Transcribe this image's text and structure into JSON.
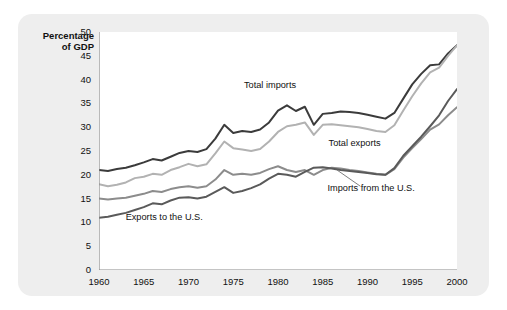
{
  "axis_title": "Percentage\nof GDP",
  "chart_data": {
    "type": "line",
    "title": "",
    "xlabel": "",
    "ylabel": "Percentage of GDP",
    "xlim": [
      1960,
      2000
    ],
    "ylim": [
      0,
      50
    ],
    "grid": false,
    "legend_position": "inline-annotations",
    "y_ticks": [
      0,
      5,
      10,
      15,
      20,
      25,
      30,
      35,
      40,
      45,
      50
    ],
    "x_ticks": [
      1960,
      1965,
      1970,
      1975,
      1980,
      1985,
      1990,
      1995,
      2000
    ],
    "x": [
      1960,
      1961,
      1962,
      1963,
      1964,
      1965,
      1966,
      1967,
      1968,
      1969,
      1970,
      1971,
      1972,
      1973,
      1974,
      1975,
      1976,
      1977,
      1978,
      1979,
      1980,
      1981,
      1982,
      1983,
      1984,
      1985,
      1986,
      1987,
      1988,
      1989,
      1990,
      1991,
      1992,
      1993,
      1994,
      1995,
      1996,
      1997,
      1998,
      1999,
      2000
    ],
    "series": [
      {
        "name": "Total imports",
        "color": "#3b3b3b",
        "values": [
          21.0,
          20.8,
          21.2,
          21.5,
          22.0,
          22.6,
          23.3,
          23.0,
          23.8,
          24.6,
          25.0,
          24.8,
          25.4,
          27.6,
          30.5,
          28.8,
          29.2,
          29.0,
          29.5,
          31.0,
          33.5,
          34.6,
          33.4,
          34.3,
          30.5,
          32.8,
          33.0,
          33.3,
          33.2,
          33.0,
          32.6,
          32.2,
          31.8,
          33.0,
          36.0,
          39.0,
          41.2,
          43.0,
          43.2,
          45.5,
          47.2
        ]
      },
      {
        "name": "Total exports",
        "color": "#b2b2b2",
        "values": [
          18.0,
          17.6,
          17.9,
          18.4,
          19.3,
          19.6,
          20.2,
          20.0,
          21.0,
          21.6,
          22.3,
          21.8,
          22.2,
          24.5,
          27.0,
          25.6,
          25.3,
          25.0,
          25.4,
          27.0,
          29.0,
          30.2,
          30.5,
          31.0,
          28.4,
          30.5,
          30.6,
          30.4,
          30.2,
          30.0,
          29.6,
          29.2,
          29.0,
          30.4,
          33.5,
          36.5,
          39.2,
          41.5,
          42.5,
          45.0,
          47.2
        ]
      },
      {
        "name": "Imports from the U.S.",
        "color": "#8c8c8c",
        "values": [
          15.0,
          14.8,
          15.0,
          15.2,
          15.6,
          16.0,
          16.6,
          16.4,
          17.0,
          17.4,
          17.6,
          17.3,
          17.6,
          19.0,
          21.0,
          20.0,
          20.2,
          20.0,
          20.4,
          21.2,
          21.8,
          21.0,
          20.6,
          21.0,
          20.0,
          21.0,
          21.5,
          21.3,
          21.0,
          20.8,
          20.5,
          20.2,
          20.0,
          21.2,
          23.6,
          25.6,
          27.5,
          29.5,
          30.6,
          32.5,
          34.2
        ]
      },
      {
        "name": "Exports to the U.S.",
        "color": "#5a5a5a",
        "values": [
          11.0,
          11.2,
          11.6,
          12.0,
          12.6,
          13.2,
          14.0,
          13.8,
          14.6,
          15.2,
          15.3,
          15.0,
          15.4,
          16.4,
          17.4,
          16.2,
          16.6,
          17.2,
          18.0,
          19.2,
          20.2,
          20.0,
          19.6,
          20.6,
          21.5,
          21.6,
          21.3,
          21.0,
          20.8,
          20.6,
          20.4,
          20.1,
          20.0,
          21.4,
          24.0,
          26.0,
          28.0,
          30.2,
          32.5,
          35.5,
          38.0
        ]
      }
    ],
    "annotations": [
      {
        "text": "Total imports",
        "x": 1980,
        "y": 37.5
      },
      {
        "text": "Total exports",
        "x": 1989,
        "y": 26.0
      },
      {
        "text": "Imports from the U.S.",
        "x": 1990,
        "y": 17.0
      },
      {
        "text": "Exports to the U.S.",
        "x": 1967,
        "y": 11.0
      }
    ]
  }
}
